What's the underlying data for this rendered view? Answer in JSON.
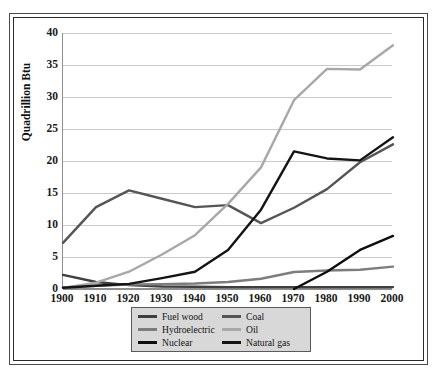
{
  "chart_data": {
    "type": "line",
    "title": "",
    "xlabel": "",
    "ylabel": "Quadrillion Btu",
    "x": [
      1900,
      1910,
      1920,
      1930,
      1940,
      1950,
      1960,
      1970,
      1980,
      1990,
      2000
    ],
    "categories": [
      "1900",
      "1910",
      "1920",
      "1930",
      "1940",
      "1950",
      "1960",
      "1970",
      "1980",
      "1990",
      "2000"
    ],
    "xlim": [
      1900,
      2000
    ],
    "ylim": [
      0,
      40
    ],
    "y_ticks": [
      0,
      5,
      10,
      15,
      20,
      25,
      30,
      35,
      40
    ],
    "y_tick_labels": [
      "0",
      "5",
      "10",
      "15",
      "20",
      "25",
      "30",
      "35",
      "40"
    ],
    "grid": "horizontal",
    "legend_position": "bottom",
    "legend_columns": 2,
    "series": [
      {
        "name": "Fuel wood",
        "color": "#3f3f3f",
        "values": [
          2.2,
          1.1,
          0.6,
          0.4,
          0.35,
          0.3,
          0.3,
          0.3,
          0.3,
          0.3,
          0.3
        ]
      },
      {
        "name": "Hydroelectric",
        "color": "#7d7d7d",
        "values": [
          0.25,
          0.5,
          0.7,
          0.75,
          0.85,
          1.1,
          1.6,
          2.65,
          2.9,
          3.0,
          3.5
        ]
      },
      {
        "name": "Nuclear",
        "color": "#0d0d0d",
        "values": [
          null,
          null,
          null,
          null,
          null,
          null,
          null,
          0.0,
          2.7,
          6.1,
          8.3
        ]
      },
      {
        "name": "Coal",
        "color": "#555555",
        "values": [
          7.2,
          12.8,
          15.4,
          14.1,
          12.8,
          13.1,
          10.3,
          12.7,
          15.6,
          19.8,
          22.6
        ]
      },
      {
        "name": "Oil",
        "color": "#a8a8a8",
        "values": [
          0.15,
          1.0,
          2.7,
          5.4,
          8.4,
          13.3,
          19.0,
          29.5,
          34.4,
          34.3,
          38.1
        ]
      },
      {
        "name": "Natural gas",
        "color": "#141414",
        "values": [
          0.2,
          0.5,
          0.8,
          1.7,
          2.7,
          6.1,
          12.4,
          21.5,
          20.4,
          20.1,
          23.7
        ]
      }
    ]
  },
  "legend": {
    "entries": [
      {
        "label": "Fuel wood",
        "color": "#3f3f3f"
      },
      {
        "label": "Coal",
        "color": "#555555"
      },
      {
        "label": "Hydroelectric",
        "color": "#7d7d7d"
      },
      {
        "label": "Oil",
        "color": "#a8a8a8"
      },
      {
        "label": "Nuclear",
        "color": "#0d0d0d"
      },
      {
        "label": "Natural gas",
        "color": "#141414"
      }
    ]
  },
  "axes": {
    "y_title": "Quadrillion Btu"
  }
}
